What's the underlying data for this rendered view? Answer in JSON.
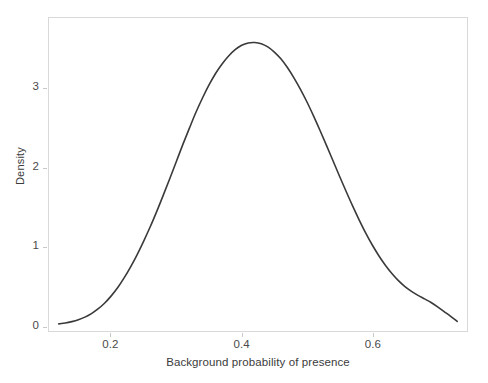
{
  "chart_data": {
    "type": "line",
    "title": "",
    "subtitle": "",
    "xlabel": "Background probability of presence",
    "ylabel": "Density",
    "xlim": [
      0.105,
      0.745
    ],
    "ylim": [
      -0.06,
      3.89
    ],
    "xticks": [
      0.2,
      0.4,
      0.6
    ],
    "xticklabels": [
      "0.2",
      "0.4",
      "0.6"
    ],
    "yticks": [
      0,
      1,
      2,
      3
    ],
    "yticklabels": [
      "0",
      "1",
      "2",
      "3"
    ],
    "grid": false,
    "legend": null,
    "annotations": [],
    "line_color": "#3a3a3a",
    "line_width": 1.6,
    "frame_color": "#d9d9d9",
    "series": [
      {
        "name": "Density",
        "x": [
          0.12,
          0.13,
          0.14,
          0.15,
          0.16,
          0.17,
          0.18,
          0.19,
          0.2,
          0.21,
          0.22,
          0.23,
          0.24,
          0.25,
          0.26,
          0.27,
          0.28,
          0.29,
          0.3,
          0.31,
          0.32,
          0.33,
          0.34,
          0.35,
          0.36,
          0.37,
          0.38,
          0.39,
          0.4,
          0.41,
          0.42,
          0.43,
          0.44,
          0.45,
          0.46,
          0.47,
          0.48,
          0.49,
          0.5,
          0.51,
          0.52,
          0.53,
          0.54,
          0.55,
          0.56,
          0.57,
          0.58,
          0.59,
          0.6,
          0.61,
          0.62,
          0.63,
          0.64,
          0.65,
          0.66,
          0.67,
          0.68,
          0.69,
          0.7,
          0.71,
          0.72,
          0.73
        ],
        "y": [
          0.03,
          0.04,
          0.058,
          0.082,
          0.115,
          0.16,
          0.218,
          0.29,
          0.38,
          0.485,
          0.61,
          0.75,
          0.905,
          1.075,
          1.255,
          1.45,
          1.655,
          1.865,
          2.08,
          2.295,
          2.5,
          2.7,
          2.88,
          3.045,
          3.19,
          3.31,
          3.41,
          3.49,
          3.545,
          3.575,
          3.58,
          3.565,
          3.525,
          3.46,
          3.375,
          3.265,
          3.135,
          2.99,
          2.83,
          2.655,
          2.47,
          2.28,
          2.085,
          1.89,
          1.7,
          1.515,
          1.34,
          1.175,
          1.025,
          0.89,
          0.77,
          0.665,
          0.575,
          0.5,
          0.44,
          0.39,
          0.345,
          0.3,
          0.245,
          0.185,
          0.125,
          0.06
        ]
      }
    ]
  },
  "axes": {
    "y_title": "Density",
    "x_title": "Background probability of presence",
    "y_labels": [
      "3",
      "2",
      "1",
      "0"
    ],
    "x_labels": [
      "0.2",
      "0.4",
      "0.6"
    ]
  }
}
